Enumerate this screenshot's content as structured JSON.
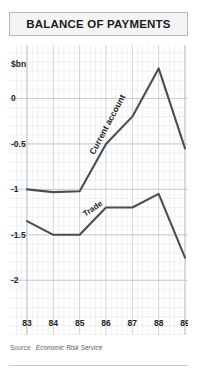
{
  "header": {
    "title": "BALANCE OF PAYMENTS"
  },
  "source": {
    "label": "Source",
    "separator": ":",
    "name": "Economic Risk Service"
  },
  "colors": {
    "line": "#4d4d4d",
    "grid_minor": "#dfe3ea",
    "grid_major": "#c2c8d2",
    "title_bg": "#f4f4f4",
    "title_border": "#b9b9b9",
    "text": "#231f20",
    "source_text": "#6d6d6d"
  },
  "chart_data": {
    "type": "line",
    "title": "BALANCE OF PAYMENTS",
    "unit_label": "$bn",
    "xlabel": "",
    "ylabel": "$bn",
    "x": [
      "83",
      "84",
      "85",
      "86",
      "87",
      "88",
      "89"
    ],
    "categories": [
      "83",
      "84",
      "85",
      "86",
      "87",
      "88",
      "89"
    ],
    "ytick_labels": [
      "0",
      "-0.5",
      "-1",
      "-1.5",
      "-2"
    ],
    "yticks": [
      0,
      -0.5,
      -1,
      -1.5,
      -2
    ],
    "ylim": [
      -2.25,
      0.5
    ],
    "xlim": [
      "83",
      "89"
    ],
    "grid": true,
    "grid_style": "fine square mesh, minor lines every 1/5 interval",
    "legend": "inline labels on lines",
    "series": [
      {
        "name": "Current account",
        "label": "Current account",
        "label_rotation": -62,
        "values": [
          -1.0,
          -1.03,
          -1.02,
          -0.5,
          -0.2,
          0.33,
          -0.55
        ]
      },
      {
        "name": "Trade",
        "label": "Trade",
        "label_rotation": -34,
        "values": [
          -1.35,
          -1.5,
          -1.5,
          -1.2,
          -1.2,
          -1.05,
          -1.75
        ]
      }
    ]
  }
}
